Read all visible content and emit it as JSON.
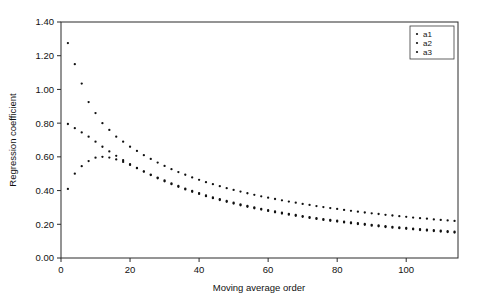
{
  "chart_data": {
    "type": "scatter",
    "title": "",
    "subtitle": "",
    "xlabel": "Moving average order",
    "ylabel": "Regression coefficient",
    "xlim": [
      0,
      115
    ],
    "ylim": [
      0.0,
      1.4
    ],
    "xticks": [
      0,
      20,
      40,
      60,
      80,
      100
    ],
    "xtick_labels": [
      "0",
      "20",
      "40",
      "60",
      "80",
      "100"
    ],
    "yticks": [
      0.0,
      0.2,
      0.4,
      0.6,
      0.8,
      1.0,
      1.2,
      1.4
    ],
    "ytick_labels": [
      "0.00",
      "0.20",
      "0.40",
      "0.60",
      "0.80",
      "1.00",
      "1.20",
      "1.40"
    ],
    "grid": false,
    "legend_position": "top-right",
    "marker": "dot",
    "marker_color": "#111111",
    "legend": [
      "a1",
      "a2",
      "a3"
    ],
    "series": [
      {
        "name": "a1",
        "x": [
          2,
          4,
          6,
          8,
          10,
          12,
          14,
          16,
          18,
          20,
          22,
          24,
          26,
          28,
          30,
          32,
          34,
          36,
          38,
          40,
          42,
          44,
          46,
          48,
          50,
          52,
          54,
          56,
          58,
          60,
          62,
          64,
          66,
          68,
          70,
          72,
          74,
          76,
          78,
          80,
          82,
          84,
          86,
          88,
          90,
          92,
          94,
          96,
          98,
          100,
          102,
          104,
          106,
          108,
          110,
          112,
          114
        ],
        "y": [
          1.275,
          1.15,
          1.035,
          0.925,
          0.86,
          0.8,
          0.76,
          0.72,
          0.69,
          0.66,
          0.635,
          0.61,
          0.588,
          0.566,
          0.546,
          0.527,
          0.51,
          0.494,
          0.478,
          0.464,
          0.45,
          0.438,
          0.426,
          0.414,
          0.404,
          0.394,
          0.384,
          0.375,
          0.366,
          0.358,
          0.35,
          0.342,
          0.335,
          0.328,
          0.321,
          0.315,
          0.308,
          0.302,
          0.296,
          0.291,
          0.285,
          0.28,
          0.275,
          0.27,
          0.265,
          0.261,
          0.256,
          0.252,
          0.248,
          0.244,
          0.24,
          0.236,
          0.233,
          0.229,
          0.226,
          0.223,
          0.22
        ]
      },
      {
        "name": "a2",
        "x": [
          2,
          4,
          6,
          8,
          10,
          12,
          14,
          16,
          18,
          20,
          22,
          24,
          26,
          28,
          30,
          32,
          34,
          36,
          38,
          40,
          42,
          44,
          46,
          48,
          50,
          52,
          54,
          56,
          58,
          60,
          62,
          64,
          66,
          68,
          70,
          72,
          74,
          76,
          78,
          80,
          82,
          84,
          86,
          88,
          90,
          92,
          94,
          96,
          98,
          100,
          102,
          104,
          106,
          108,
          110,
          112,
          114
        ],
        "y": [
          0.795,
          0.77,
          0.745,
          0.72,
          0.69,
          0.66,
          0.632,
          0.606,
          0.58,
          0.556,
          0.534,
          0.512,
          0.492,
          0.473,
          0.455,
          0.438,
          0.422,
          0.407,
          0.393,
          0.38,
          0.367,
          0.355,
          0.344,
          0.333,
          0.323,
          0.313,
          0.304,
          0.295,
          0.287,
          0.279,
          0.271,
          0.264,
          0.257,
          0.25,
          0.244,
          0.238,
          0.232,
          0.226,
          0.221,
          0.216,
          0.211,
          0.206,
          0.201,
          0.197,
          0.192,
          0.188,
          0.184,
          0.18,
          0.177,
          0.173,
          0.17,
          0.166,
          0.163,
          0.16,
          0.157,
          0.154,
          0.151
        ]
      },
      {
        "name": "a3",
        "x": [
          2,
          4,
          6,
          8,
          10,
          12,
          14,
          16,
          18,
          20,
          22,
          24,
          26,
          28,
          30,
          32,
          34,
          36,
          38,
          40,
          42,
          44,
          46,
          48,
          50,
          52,
          54,
          56,
          58,
          60,
          62,
          64,
          66,
          68,
          70,
          72,
          74,
          76,
          78,
          80,
          82,
          84,
          86,
          88,
          90,
          92,
          94,
          96,
          98,
          100,
          102,
          104,
          106,
          108,
          110,
          112,
          114
        ],
        "y": [
          0.41,
          0.5,
          0.545,
          0.575,
          0.595,
          0.6,
          0.596,
          0.585,
          0.57,
          0.552,
          0.533,
          0.514,
          0.495,
          0.477,
          0.46,
          0.443,
          0.427,
          0.412,
          0.398,
          0.385,
          0.372,
          0.36,
          0.349,
          0.338,
          0.328,
          0.318,
          0.309,
          0.3,
          0.292,
          0.284,
          0.276,
          0.269,
          0.262,
          0.255,
          0.249,
          0.243,
          0.237,
          0.231,
          0.226,
          0.221,
          0.216,
          0.211,
          0.206,
          0.202,
          0.197,
          0.193,
          0.189,
          0.185,
          0.181,
          0.178,
          0.174,
          0.171,
          0.168,
          0.165,
          0.162,
          0.159,
          0.156
        ]
      }
    ]
  },
  "legend": {
    "items": [
      {
        "label": "a1"
      },
      {
        "label": "a2"
      },
      {
        "label": "a3"
      }
    ]
  }
}
